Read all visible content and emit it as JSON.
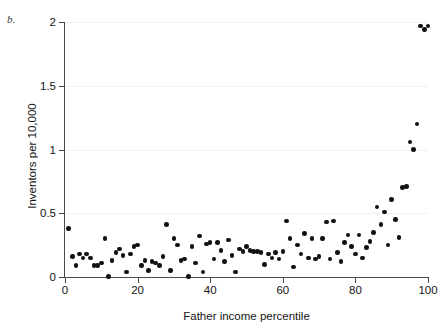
{
  "figure": {
    "panel_letter": "b.",
    "background_color": "#ffffff",
    "marker_color": "#111111",
    "axis_color": "#4a4a4a",
    "gridline_color": "#f1f1f1"
  },
  "chart_data": {
    "type": "scatter",
    "title": "",
    "subtitle": "",
    "panel_label": "b.",
    "xlabel": "Father income percentile",
    "ylabel": "Inventors per 10,000",
    "xlim": [
      0,
      100
    ],
    "ylim": [
      0,
      2
    ],
    "xticks": [
      0,
      20,
      40,
      60,
      80,
      100
    ],
    "xtick_labels": [
      "0",
      "20",
      "40",
      "60",
      "80",
      "100"
    ],
    "yticks": [
      0,
      0.5,
      1,
      1.5,
      2
    ],
    "ytick_labels": [
      "0",
      "0.5",
      "1",
      "1.5",
      "2"
    ],
    "grid": "horizontal-faint",
    "legend": null,
    "marker": "filled-circle",
    "series": [
      {
        "name": "Inventors per 10,000 by father income percentile",
        "points": [
          [
            1,
            0.38
          ],
          [
            2,
            0.16
          ],
          [
            3,
            0.09
          ],
          [
            4,
            0.18
          ],
          [
            5,
            0.15
          ],
          [
            6,
            0.18
          ],
          [
            7,
            0.15
          ],
          [
            8,
            0.09
          ],
          [
            9,
            0.09
          ],
          [
            10,
            0.11
          ],
          [
            11,
            0.3
          ],
          [
            12,
            0.005
          ],
          [
            13,
            0.13
          ],
          [
            14,
            0.19
          ],
          [
            15,
            0.22
          ],
          [
            16,
            0.17
          ],
          [
            17,
            0.04
          ],
          [
            18,
            0.18
          ],
          [
            19,
            0.24
          ],
          [
            20,
            0.25
          ],
          [
            21,
            0.09
          ],
          [
            22,
            0.13
          ],
          [
            23,
            0.05
          ],
          [
            24,
            0.12
          ],
          [
            25,
            0.11
          ],
          [
            26,
            0.09
          ],
          [
            27,
            0.16
          ],
          [
            28,
            0.41
          ],
          [
            29,
            0.05
          ],
          [
            30,
            0.3
          ],
          [
            31,
            0.25
          ],
          [
            32,
            0.13
          ],
          [
            33,
            0.14
          ],
          [
            34,
            0.005
          ],
          [
            35,
            0.24
          ],
          [
            36,
            0.11
          ],
          [
            37,
            0.32
          ],
          [
            38,
            0.04
          ],
          [
            39,
            0.26
          ],
          [
            40,
            0.27
          ],
          [
            41,
            0.14
          ],
          [
            42,
            0.27
          ],
          [
            43,
            0.21
          ],
          [
            44,
            0.12
          ],
          [
            45,
            0.29
          ],
          [
            46,
            0.17
          ],
          [
            47,
            0.04
          ],
          [
            48,
            0.22
          ],
          [
            49,
            0.2
          ],
          [
            50,
            0.24
          ],
          [
            51,
            0.21
          ],
          [
            52,
            0.2
          ],
          [
            53,
            0.2
          ],
          [
            54,
            0.19
          ],
          [
            55,
            0.1
          ],
          [
            56,
            0.18
          ],
          [
            57,
            0.15
          ],
          [
            58,
            0.19
          ],
          [
            59,
            0.14
          ],
          [
            60,
            0.2
          ],
          [
            61,
            0.44
          ],
          [
            62,
            0.3
          ],
          [
            63,
            0.08
          ],
          [
            64,
            0.25
          ],
          [
            65,
            0.18
          ],
          [
            66,
            0.34
          ],
          [
            67,
            0.15
          ],
          [
            68,
            0.3
          ],
          [
            69,
            0.14
          ],
          [
            70,
            0.16
          ],
          [
            71,
            0.3
          ],
          [
            72,
            0.43
          ],
          [
            73,
            0.14
          ],
          [
            74,
            0.44
          ],
          [
            75,
            0.19
          ],
          [
            76,
            0.12
          ],
          [
            77,
            0.27
          ],
          [
            78,
            0.33
          ],
          [
            79,
            0.24
          ],
          [
            80,
            0.18
          ],
          [
            81,
            0.33
          ],
          [
            82,
            0.15
          ],
          [
            83,
            0.23
          ],
          [
            84,
            0.28
          ],
          [
            85,
            0.35
          ],
          [
            86,
            0.55
          ],
          [
            87,
            0.41
          ],
          [
            88,
            0.51
          ],
          [
            89,
            0.25
          ],
          [
            90,
            0.61
          ],
          [
            91,
            0.45
          ],
          [
            92,
            0.31
          ],
          [
            93,
            0.7
          ],
          [
            94,
            0.71
          ],
          [
            95,
            1.06
          ],
          [
            96,
            1.0
          ],
          [
            97,
            1.2
          ],
          [
            98,
            1.97
          ],
          [
            99,
            1.94
          ],
          [
            100,
            1.97
          ]
        ]
      }
    ]
  }
}
